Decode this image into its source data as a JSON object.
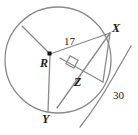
{
  "figure": {
    "kind": "circle-geometry-diagram",
    "colors": {
      "background": "#ffffff",
      "stroke": "#808080",
      "label": "#1a1a1a",
      "center_dot": "#000000"
    },
    "points": [
      {
        "name": "X",
        "label": "X",
        "x": 110,
        "y": 33
      },
      {
        "name": "Y",
        "label": "Y",
        "x": 48,
        "y": 112
      },
      {
        "name": "Z",
        "label": "Z",
        "x": 78,
        "y": 72
      },
      {
        "name": "R",
        "label": "R",
        "x": 50,
        "y": 54
      }
    ],
    "measures": [
      {
        "name": "radius-RX",
        "label": "17",
        "value": 17,
        "x": 68,
        "y": 41
      },
      {
        "name": "external-segment",
        "label": "30",
        "value": 30,
        "x": 117,
        "y": 95
      }
    ],
    "circle": {
      "cx": 58,
      "cy": 60,
      "r": 53
    },
    "right_angle": {
      "at": "Z",
      "marker": "square",
      "size": 8
    }
  }
}
